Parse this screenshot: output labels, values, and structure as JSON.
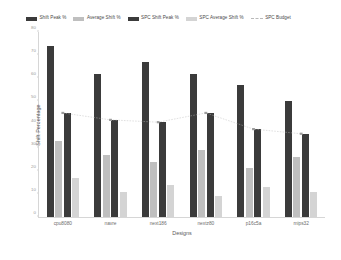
{
  "chart_data": {
    "type": "bar",
    "title": "",
    "xlabel": "Designs",
    "ylabel": "Shift Percentage",
    "ylim": [
      0,
      80
    ],
    "yticks": [
      0,
      10,
      20,
      30,
      40,
      50,
      60,
      70,
      80
    ],
    "grid": false,
    "legend_position": "top",
    "categories": [
      "cpu8080",
      "navre",
      "next186",
      "nextz80",
      "p16c5a",
      "mips32"
    ],
    "series": [
      {
        "name": "Shift Peak %",
        "type": "bar",
        "color": "#3b3b3b",
        "values": [
          74,
          62,
          67,
          62,
          57,
          50
        ]
      },
      {
        "name": "Average Shift %",
        "type": "bar",
        "color": "#bfbfbf",
        "values": [
          33,
          27,
          24,
          29,
          21,
          26
        ]
      },
      {
        "name": "SPC Shift Peak %",
        "type": "bar",
        "color": "#3b3b3b",
        "values": [
          45,
          42,
          41,
          45,
          38,
          36
        ]
      },
      {
        "name": "SPC Average Shift %",
        "type": "bar",
        "color": "#d4d4d4",
        "values": [
          17,
          11,
          14,
          9,
          13,
          11
        ]
      },
      {
        "name": "SPC Budget",
        "type": "line",
        "style": "dashed",
        "color": "#b9b9b9",
        "values": [
          45,
          42,
          41,
          45,
          38,
          36
        ]
      }
    ]
  },
  "legend": {
    "items": [
      {
        "label": "Shift Peak %",
        "color": "#3b3b3b",
        "marker": "box"
      },
      {
        "label": "Average Shift %",
        "color": "#bfbfbf",
        "marker": "box"
      },
      {
        "label": "SPC Shift Peak %",
        "color": "#3b3b3b",
        "marker": "box"
      },
      {
        "label": "SPC Average Shift %",
        "color": "#d4d4d4",
        "marker": "box"
      },
      {
        "label": "SPC Budget",
        "color": "#b9b9b9",
        "marker": "dashed-line"
      }
    ]
  },
  "axes": {
    "y_title": "Shift Percentage",
    "x_title": "Designs",
    "y_tick_labels": [
      "0",
      "10",
      "20",
      "30",
      "40",
      "50",
      "60",
      "70",
      "80"
    ],
    "x_tick_labels": [
      "cpu8080",
      "navre",
      "next186",
      "nextz80",
      "p16c5a",
      "mips32"
    ]
  }
}
